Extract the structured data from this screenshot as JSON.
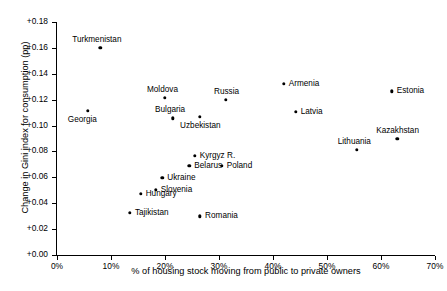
{
  "chart_data": {
    "type": "scatter",
    "title": "",
    "xlabel": "% of housing stock moving from public to private owners",
    "ylabel": "Change in Gini index for consumption (pp)",
    "xlim": [
      0,
      70
    ],
    "ylim": [
      0.0,
      0.18
    ],
    "grid": false,
    "legend": "none",
    "xticks": [
      "0%",
      "10%",
      "20%",
      "30%",
      "40%",
      "50%",
      "60%",
      "70%"
    ],
    "xtick_values": [
      0,
      10,
      20,
      30,
      40,
      50,
      60,
      70
    ],
    "yticks": [
      "+0.00",
      "+0.02",
      "+0.04",
      "+0.06",
      "+0.08",
      "+0.10",
      "+0.12",
      "+0.14",
      "+0.16",
      "+0.18"
    ],
    "ytick_values": [
      0.0,
      0.02,
      0.04,
      0.06,
      0.08,
      0.1,
      0.12,
      0.14,
      0.16,
      0.18
    ],
    "points": [
      {
        "label": "Turkmenistan",
        "x": 8.0,
        "y": 0.16,
        "label_dx": -28,
        "label_dy": -13
      },
      {
        "label": "Georgia",
        "x": 5.7,
        "y": 0.1115,
        "label_dx": -20,
        "label_dy": 4
      },
      {
        "label": "Moldova",
        "x": 20.0,
        "y": 0.1215,
        "label_dx": -18,
        "label_dy": -13
      },
      {
        "label": "Bulgaria",
        "x": 21.5,
        "y": 0.1055,
        "label_dx": -18,
        "label_dy": -13
      },
      {
        "label": "Uzbekistan",
        "x": 26.5,
        "y": 0.107,
        "label_dx": -20,
        "label_dy": 4
      },
      {
        "label": "Russia",
        "x": 31.3,
        "y": 0.12,
        "label_dx": -12,
        "label_dy": -13
      },
      {
        "label": "Armenia",
        "x": 42.0,
        "y": 0.1325,
        "label_dx": 5,
        "label_dy": -5
      },
      {
        "label": "Latvia",
        "x": 44.2,
        "y": 0.1105,
        "label_dx": 5,
        "label_dy": -5
      },
      {
        "label": "Estonia",
        "x": 62.0,
        "y": 0.1265,
        "label_dx": 5,
        "label_dy": -5
      },
      {
        "label": "Kazakhstan",
        "x": 63.0,
        "y": 0.0895,
        "label_dx": -21,
        "label_dy": -13
      },
      {
        "label": "Lithuania",
        "x": 55.5,
        "y": 0.0815,
        "label_dx": -19,
        "label_dy": -13
      },
      {
        "label": "Kyrgyz R.",
        "x": 25.5,
        "y": 0.0765,
        "label_dx": 5,
        "label_dy": -5
      },
      {
        "label": "Belarus",
        "x": 24.5,
        "y": 0.069,
        "label_dx": 5,
        "label_dy": -5
      },
      {
        "label": "Poland",
        "x": 30.5,
        "y": 0.069,
        "label_dx": 5,
        "label_dy": -5
      },
      {
        "label": "Ukraine",
        "x": 19.5,
        "y": 0.0595,
        "label_dx": 5,
        "label_dy": -5
      },
      {
        "label": "Slovenia",
        "x": 18.3,
        "y": 0.0505,
        "label_dx": 5,
        "label_dy": -5
      },
      {
        "label": "Hungary",
        "x": 15.5,
        "y": 0.0475,
        "label_dx": 5,
        "label_dy": -5
      },
      {
        "label": "Tajikistan",
        "x": 13.5,
        "y": 0.0325,
        "label_dx": 5,
        "label_dy": -5
      },
      {
        "label": "Romania",
        "x": 26.5,
        "y": 0.03,
        "label_dx": 5,
        "label_dy": -5
      }
    ]
  }
}
